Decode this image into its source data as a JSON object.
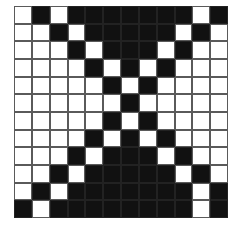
{
  "figure": {
    "kind": "bitmap-grid",
    "rows": 12,
    "columns": 12,
    "colors": {
      "on": "#111111",
      "off": "#ffffff",
      "gridline": "#5a5a5a",
      "background": "#ffffff"
    },
    "legend": {
      "on_label": "filled",
      "off_label": "empty"
    },
    "matrix": [
      [
        0,
        1,
        0,
        1,
        1,
        1,
        1,
        1,
        1,
        1,
        0,
        1
      ],
      [
        0,
        0,
        1,
        0,
        1,
        1,
        1,
        1,
        1,
        0,
        1,
        0
      ],
      [
        0,
        0,
        0,
        1,
        0,
        1,
        1,
        1,
        0,
        1,
        0,
        0
      ],
      [
        0,
        0,
        0,
        0,
        1,
        0,
        1,
        0,
        1,
        0,
        0,
        0
      ],
      [
        0,
        0,
        0,
        0,
        0,
        1,
        0,
        1,
        0,
        0,
        0,
        0
      ],
      [
        0,
        0,
        0,
        0,
        0,
        0,
        1,
        0,
        0,
        0,
        0,
        0
      ],
      [
        0,
        0,
        0,
        0,
        0,
        1,
        0,
        1,
        0,
        0,
        0,
        0
      ],
      [
        0,
        0,
        0,
        0,
        1,
        0,
        1,
        0,
        1,
        0,
        0,
        0
      ],
      [
        0,
        0,
        0,
        1,
        0,
        1,
        1,
        1,
        0,
        1,
        0,
        0
      ],
      [
        0,
        0,
        1,
        0,
        1,
        1,
        1,
        1,
        1,
        0,
        1,
        0
      ],
      [
        0,
        1,
        0,
        1,
        1,
        1,
        1,
        1,
        1,
        1,
        0,
        1
      ],
      [
        1,
        0,
        1,
        1,
        1,
        1,
        1,
        1,
        1,
        1,
        0,
        1
      ]
    ]
  }
}
